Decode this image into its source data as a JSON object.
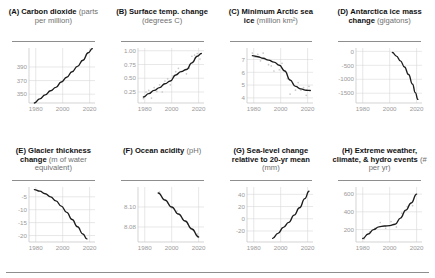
{
  "figure": {
    "background": "#ffffff",
    "line_color": "#1c1c1c",
    "point_color": "#c9c9c9",
    "grid_color": "#d9d9d9",
    "tick_label_color": "#9a9a9a",
    "rule_color": "#8e8e8e"
  },
  "chart_data": [
    {
      "type": "line",
      "panel": "A",
      "label": "(A)",
      "title": "Carbon dioxide",
      "units": "(parts per million)",
      "xlabel": "",
      "ylabel": "",
      "xlim": [
        1975,
        2024
      ],
      "ylim": [
        337,
        418
      ],
      "xticks": [
        1980,
        2000,
        2020
      ],
      "yticks": [
        350,
        370,
        390
      ],
      "grid": true,
      "has_points": false,
      "x": [
        1979,
        1983,
        1987,
        1991,
        1995,
        1999,
        2003,
        2007,
        2011,
        2015,
        2019,
        2022
      ],
      "values": [
        337,
        343,
        349,
        355,
        360,
        368,
        375,
        383,
        391,
        400,
        411,
        417
      ]
    },
    {
      "type": "line",
      "panel": "B",
      "label": "(B)",
      "title": "Surface temp. change",
      "units": "(degrees C)",
      "xlabel": "",
      "ylabel": "",
      "xlim": [
        1975,
        2024
      ],
      "ylim": [
        0.05,
        1.05
      ],
      "xticks": [
        1980,
        2000,
        2020
      ],
      "yticks": [
        0.25,
        0.5,
        0.75,
        1.0
      ],
      "ytick_labels": [
        "0.25",
        "0.50",
        "0.75",
        "1.00"
      ],
      "grid": true,
      "has_points": true,
      "x": [
        1979,
        1983,
        1987,
        1991,
        1995,
        1999,
        2003,
        2007,
        2011,
        2015,
        2019,
        2022
      ],
      "values": [
        0.16,
        0.22,
        0.28,
        0.33,
        0.4,
        0.45,
        0.56,
        0.62,
        0.66,
        0.78,
        0.9,
        0.95
      ],
      "scatter_x": [
        1979,
        1981,
        1983,
        1985,
        1987,
        1989,
        1991,
        1993,
        1995,
        1997,
        1999,
        2001,
        2003,
        2005,
        2007,
        2009,
        2011,
        2013,
        2015,
        2017,
        2019,
        2021
      ],
      "scatter_y": [
        0.13,
        0.25,
        0.28,
        0.14,
        0.33,
        0.26,
        0.38,
        0.25,
        0.45,
        0.49,
        0.38,
        0.54,
        0.62,
        0.68,
        0.62,
        0.64,
        0.58,
        0.68,
        0.9,
        0.92,
        0.95,
        0.85
      ]
    },
    {
      "type": "line",
      "panel": "C",
      "label": "(C)",
      "title": "Minimum Arctic sea ice",
      "units": "(million km²)",
      "xlabel": "",
      "ylabel": "",
      "xlim": [
        1975,
        2024
      ],
      "ylim": [
        3.6,
        7.9
      ],
      "xticks": [
        1980,
        2000,
        2020
      ],
      "yticks": [
        4,
        5,
        6,
        7
      ],
      "grid": true,
      "has_points": true,
      "x": [
        1979,
        1983,
        1987,
        1991,
        1995,
        1999,
        2003,
        2007,
        2011,
        2015,
        2019,
        2022
      ],
      "values": [
        7.3,
        7.22,
        7.1,
        6.95,
        6.8,
        6.55,
        6.1,
        5.4,
        4.9,
        4.7,
        4.6,
        4.58
      ],
      "scatter_x": [
        1979,
        1981,
        1983,
        1985,
        1987,
        1989,
        1991,
        1993,
        1995,
        1997,
        1999,
        2001,
        2003,
        2005,
        2007,
        2009,
        2011,
        2013,
        2015,
        2017,
        2019,
        2021
      ],
      "scatter_y": [
        7.5,
        7.2,
        7.4,
        6.9,
        7.5,
        7.0,
        6.6,
        6.5,
        6.1,
        6.7,
        6.2,
        6.7,
        6.1,
        5.5,
        4.3,
        5.1,
        4.6,
        5.2,
        4.6,
        4.8,
        4.2,
        4.9
      ]
    },
    {
      "type": "line",
      "panel": "D",
      "label": "(D)",
      "title": "Antarctica ice mass change",
      "units": "(gigatons)",
      "xlabel": "",
      "ylabel": "",
      "xlim": [
        1975,
        2024
      ],
      "ylim": [
        -1850,
        120
      ],
      "xticks": [
        1980,
        2000,
        2020
      ],
      "yticks": [
        0,
        -500,
        -1000,
        -1500
      ],
      "grid": true,
      "has_points": false,
      "x": [
        2002,
        2005,
        2008,
        2011,
        2014,
        2017,
        2019,
        2021
      ],
      "values": [
        -40,
        -170,
        -340,
        -560,
        -830,
        -1180,
        -1480,
        -1720
      ]
    },
    {
      "type": "line",
      "panel": "E",
      "label": "(E)",
      "title": "Glacier thickness change",
      "units": "(m of water equivalent)",
      "xlabel": "",
      "ylabel": "",
      "xlim": [
        1975,
        2024
      ],
      "ylim": [
        -22.5,
        -1.2
      ],
      "xticks": [
        1980,
        2000,
        2020
      ],
      "yticks": [
        -5,
        -10,
        -15,
        -20
      ],
      "grid": true,
      "has_points": false,
      "x": [
        1979,
        1983,
        1987,
        1991,
        1995,
        1999,
        2003,
        2007,
        2011,
        2015,
        2018
      ],
      "values": [
        -2.2,
        -2.8,
        -3.8,
        -5.0,
        -6.6,
        -8.6,
        -11.0,
        -13.8,
        -16.6,
        -19.4,
        -21.3
      ]
    },
    {
      "type": "line",
      "panel": "F",
      "label": "(F)",
      "title": "Ocean acidity",
      "units": "(pH)",
      "xlabel": "",
      "ylabel": "",
      "xlim": [
        1975,
        2024
      ],
      "ylim": [
        8.065,
        8.12
      ],
      "xticks": [
        1980,
        2000,
        2020
      ],
      "yticks": [
        8.08,
        8.1
      ],
      "ytick_labels": [
        "8.08",
        "8.10"
      ],
      "grid": true,
      "has_points": true,
      "x": [
        1990,
        1995,
        2000,
        2005,
        2010,
        2015,
        2020
      ],
      "values": [
        8.114,
        8.107,
        8.1,
        8.093,
        8.086,
        8.078,
        8.07
      ],
      "scatter_x": [
        1991,
        1994,
        1997,
        2000,
        2004,
        2008,
        2012,
        2016,
        2019
      ],
      "scatter_y": [
        8.115,
        8.108,
        8.104,
        8.099,
        8.096,
        8.088,
        8.083,
        8.077,
        8.073
      ]
    },
    {
      "type": "line",
      "panel": "G",
      "label": "(G)",
      "title": "Sea-level change relative to 20-yr mean",
      "units": "(mm)",
      "xlabel": "",
      "ylabel": "",
      "xlim": [
        1975,
        2024
      ],
      "ylim": [
        -38,
        52
      ],
      "xticks": [
        1980,
        2000,
        2020
      ],
      "yticks": [
        -20,
        0,
        20,
        40
      ],
      "grid": true,
      "has_points": false,
      "x": [
        1994,
        1998,
        2002,
        2006,
        2010,
        2014,
        2018,
        2021
      ],
      "values": [
        -32,
        -24,
        -14,
        -6,
        6,
        18,
        33,
        45
      ]
    },
    {
      "type": "line",
      "panel": "H",
      "label": "(H)",
      "title": "Extreme weather, climate, & hydro events",
      "units": "(# per yr)",
      "xlabel": "",
      "ylabel": "",
      "xlim": [
        1975,
        2024
      ],
      "ylim": [
        60,
        680
      ],
      "xticks": [
        1980,
        2000,
        2020
      ],
      "yticks": [
        200,
        400,
        600
      ],
      "grid": true,
      "has_points": true,
      "x": [
        1980,
        1984,
        1988,
        1992,
        1996,
        2000,
        2004,
        2008,
        2012,
        2016,
        2020
      ],
      "values": [
        100,
        150,
        200,
        230,
        240,
        245,
        260,
        330,
        420,
        500,
        600
      ],
      "scatter_x": [
        1981,
        1985,
        1989,
        1993,
        1997,
        2001,
        2005,
        2009,
        2013,
        2017,
        2019
      ],
      "scatter_y": [
        95,
        175,
        215,
        280,
        215,
        290,
        230,
        385,
        460,
        470,
        585
      ]
    }
  ]
}
